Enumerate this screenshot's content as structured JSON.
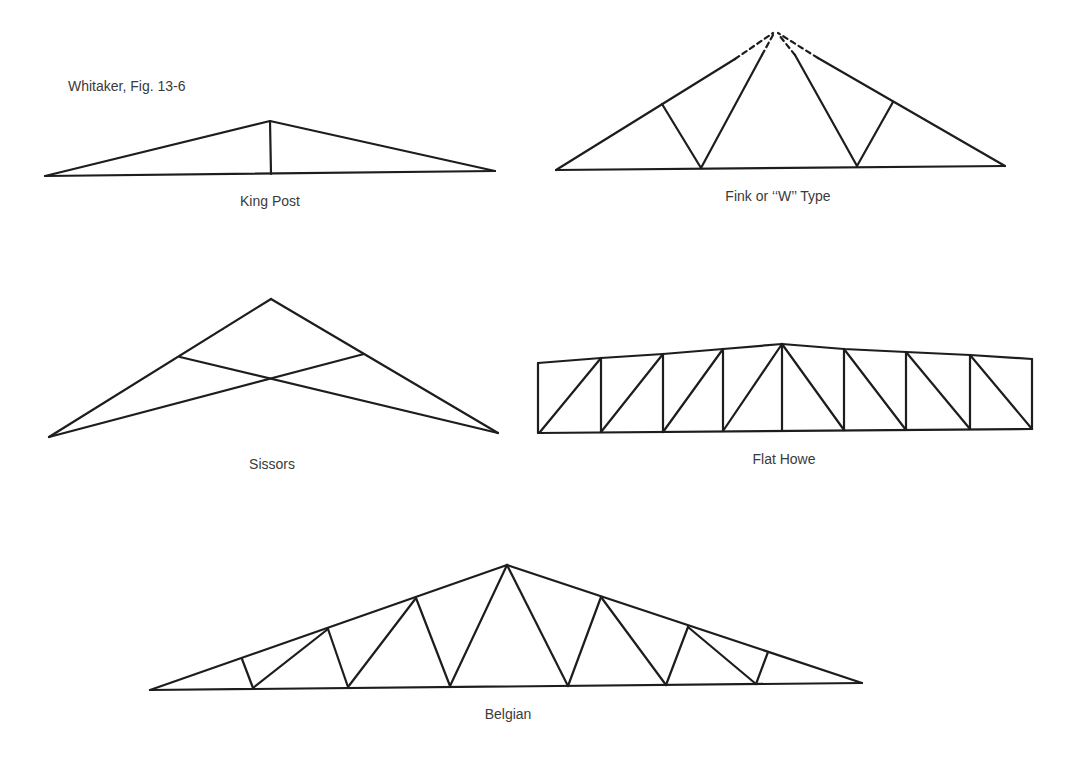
{
  "figure": {
    "source_caption": "Whitaker, Fig. 13-6"
  },
  "trusses": [
    {
      "id": "king-post",
      "label": "King Post",
      "label_pos": [
        270,
        193
      ]
    },
    {
      "id": "fink",
      "label": "Fink or ‘‘W’’ Type",
      "label_pos": [
        778,
        188
      ]
    },
    {
      "id": "sissors",
      "label": "Sissors",
      "label_pos": [
        272,
        456
      ]
    },
    {
      "id": "flat-howe",
      "label": "Flat Howe",
      "label_pos": [
        784,
        451
      ]
    },
    {
      "id": "belgian",
      "label": "Belgian",
      "label_pos": [
        508,
        706
      ]
    }
  ],
  "style": {
    "line_color": "#1d1d1d",
    "text_color": "#3a3a3a",
    "background": "#ffffff"
  }
}
